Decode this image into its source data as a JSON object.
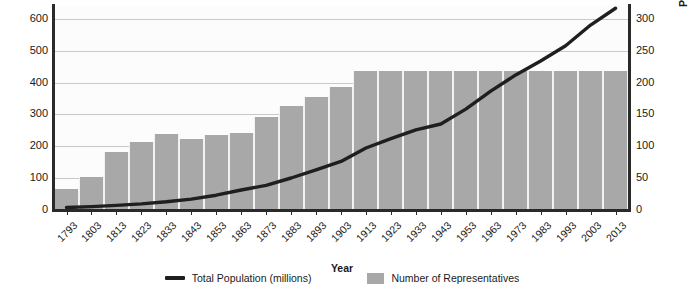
{
  "axes": {
    "left_title": "Number of Representatives",
    "right_title": "Population (millions)",
    "x_title": "Year",
    "left_ticks": [
      "0",
      "100",
      "200",
      "300",
      "400",
      "500",
      "600"
    ],
    "right_ticks": [
      "0",
      "50",
      "100",
      "150",
      "200",
      "250",
      "300"
    ]
  },
  "legend": {
    "line_label": "Total Population (millions)",
    "bar_label": "Number of Representatives"
  },
  "colors": {
    "bar": "#a8a8a8",
    "line": "#1f1f1f",
    "grid": "#c9c9c9",
    "axis": "#2a2a2a",
    "plot_bg": "#fcfcfc"
  },
  "chart_data": {
    "type": "bar",
    "title": "",
    "xlabel": "Year",
    "ylabel": "Number of Representatives",
    "y2label": "Population (millions)",
    "ylim": [
      0,
      640
    ],
    "y2lim": [
      0,
      320
    ],
    "ytick_values": [
      0,
      100,
      200,
      300,
      400,
      500,
      600
    ],
    "y2tick_values": [
      0,
      50,
      100,
      150,
      200,
      250,
      300
    ],
    "grid": true,
    "legend_position": "bottom",
    "categories": [
      "1793",
      "1803",
      "1813",
      "1823",
      "1833",
      "1843",
      "1853",
      "1863",
      "1873",
      "1883",
      "1893",
      "1903",
      "1913",
      "1923",
      "1933",
      "1943",
      "1953",
      "1963",
      "1973",
      "1983",
      "1993",
      "2003",
      "2013"
    ],
    "series": [
      {
        "name": "Number of Representatives",
        "type": "bar",
        "axis": "left",
        "values": [
          65,
          105,
          181,
          213,
          240,
          223,
          234,
          241,
          293,
          325,
          356,
          386,
          435,
          435,
          435,
          435,
          435,
          435,
          435,
          435,
          435,
          435,
          435
        ]
      },
      {
        "name": "Total Population (millions)",
        "type": "line",
        "axis": "right",
        "values": [
          3.9,
          5.3,
          7.2,
          9.6,
          12.9,
          17.1,
          23.2,
          31.4,
          38.6,
          50.2,
          62.9,
          76.2,
          97.2,
          111.9,
          125.6,
          134.9,
          158.2,
          186.5,
          211.9,
          233.8,
          257.7,
          290.1,
          316.5
        ]
      }
    ]
  }
}
